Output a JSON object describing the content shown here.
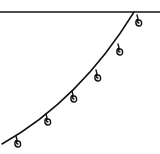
{
  "drawing": {
    "description": "Line drawing of a string of hanging loops (bunting/lights) draped from a horizontal line",
    "stroke_color": "#111111",
    "background": "#ffffff",
    "top_line": {
      "x1": 0,
      "y1": 12,
      "x2": 160,
      "y2": 12
    },
    "curve": {
      "start": [
        134,
        12
      ],
      "control": [
        80,
        100
      ],
      "end": [
        2,
        144
      ]
    },
    "loops": [
      {
        "x": 138,
        "y": 18
      },
      {
        "x": 119,
        "y": 47
      },
      {
        "x": 97,
        "y": 73
      },
      {
        "x": 73,
        "y": 94
      },
      {
        "x": 47,
        "y": 117
      },
      {
        "x": 17,
        "y": 139
      }
    ]
  }
}
